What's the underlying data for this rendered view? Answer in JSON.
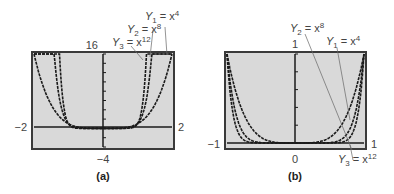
{
  "chart_data": [
    {
      "type": "line",
      "panel": "(a)",
      "title": "",
      "xlim": [
        -2,
        2
      ],
      "ylim": [
        -4,
        16
      ],
      "tick_labels": {
        "xmin": "−2",
        "xmax": "2",
        "ymin": "−4",
        "ymax": "16"
      },
      "grid": false,
      "series": [
        {
          "name": "Y1 = x^4",
          "label_main": "Y",
          "label_sub": "1",
          "label_rhs": "= x",
          "label_sup": "4",
          "exponent": 4
        },
        {
          "name": "Y2 = x^8",
          "label_main": "Y",
          "label_sub": "2",
          "label_rhs": "= x",
          "label_sup": "8",
          "exponent": 8
        },
        {
          "name": "Y3 = x^12",
          "label_main": "Y",
          "label_sub": "3",
          "label_rhs": "= x",
          "label_sup": "12",
          "exponent": 12
        }
      ]
    },
    {
      "type": "line",
      "panel": "(b)",
      "title": "",
      "xlim": [
        -1,
        1
      ],
      "ylim": [
        0,
        1
      ],
      "tick_labels": {
        "xmin": "−1",
        "xmax": "1",
        "ymin": "0",
        "ymax": "1"
      },
      "grid": false,
      "series": [
        {
          "name": "Y1 = x^4",
          "label_main": "Y",
          "label_sub": "1",
          "label_rhs": "= x",
          "label_sup": "4",
          "exponent": 4
        },
        {
          "name": "Y2 = x^8",
          "label_main": "Y",
          "label_sub": "2",
          "label_rhs": "= x",
          "label_sup": "8",
          "exponent": 8
        },
        {
          "name": "Y3 = x^12",
          "label_main": "Y",
          "label_sub": "3",
          "label_rhs": "= x",
          "label_sup": "12",
          "exponent": 12
        }
      ]
    }
  ],
  "panels": {
    "a": {
      "caption": "(a)",
      "xmin": "−2",
      "xmax": "2",
      "ymin": "−4",
      "ymax": "16"
    },
    "b": {
      "caption": "(b)",
      "xmin": "−1",
      "xmax": "1",
      "ymin": "0",
      "ymax": "1"
    }
  },
  "colors": {
    "plot_bg": "#d9d9d9",
    "frame": "#3a3a3a",
    "curve": "#1a1a1a",
    "leader": "#555555"
  }
}
